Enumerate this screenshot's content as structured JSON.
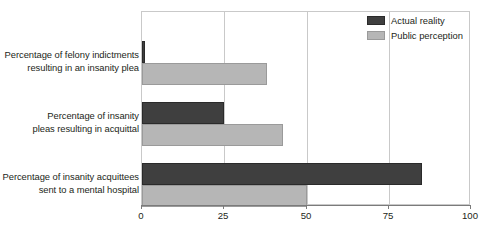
{
  "chart_data": {
    "type": "bar",
    "orientation": "horizontal",
    "title": "",
    "xlabel": "",
    "ylabel": "",
    "xlim": [
      0,
      100
    ],
    "xticks": [
      0,
      25,
      50,
      75,
      100
    ],
    "xtick_labels": [
      "0",
      "25",
      "50",
      "75",
      "100"
    ],
    "grid": "vertical",
    "legend_position": "top-right-inside",
    "categories": [
      {
        "line1": "Percentage of felony indictments",
        "line2": "resulting in an insanity plea"
      },
      {
        "line1": "Percentage of insanity",
        "line2": "pleas resulting in acquittal"
      },
      {
        "line1": "Percentage of insanity acquittees",
        "line2": "sent to a mental hospital"
      }
    ],
    "series": [
      {
        "name": "Actual reality",
        "color": "#3f3f3f",
        "values": [
          1,
          25,
          85
        ]
      },
      {
        "name": "Public perception",
        "color": "#b6b6b6",
        "values": [
          38,
          43,
          50
        ]
      }
    ]
  },
  "colors": {
    "dark_bar": "#3f3f3f",
    "light_bar": "#b6b6b6",
    "gridline": "#c9c9c9",
    "axis": "#7b7b7b",
    "text": "#231f20",
    "background": "#ffffff"
  }
}
